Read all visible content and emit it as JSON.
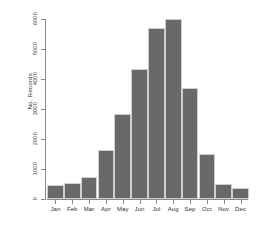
{
  "chart_data": {
    "type": "bar",
    "title": "",
    "xlabel": "",
    "ylabel": "No. Records",
    "categories": [
      "Jan",
      "Feb",
      "Mar",
      "Apr",
      "May",
      "Jun",
      "Jul",
      "Aug",
      "Sep",
      "Oct",
      "Nov",
      "Dec"
    ],
    "values": [
      480,
      550,
      720,
      1620,
      2850,
      4350,
      5700,
      6000,
      3700,
      1500,
      490,
      370
    ],
    "ylim": [
      0,
      6000
    ],
    "yticks": [
      0,
      1000,
      2000,
      3000,
      4000,
      5000,
      6000
    ],
    "ytick_labels": [
      "0",
      "1000",
      "2000",
      "3000",
      "4000",
      "5000",
      "6000"
    ],
    "grid": false,
    "legend": null,
    "bar_color": "#696969",
    "axis_color": "#8a8a8a",
    "background": "#ffffff"
  }
}
